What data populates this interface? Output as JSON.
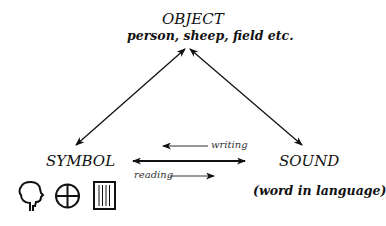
{
  "diagram": {
    "nodes": {
      "object": {
        "title": "OBJECT",
        "subtitle": "person, sheep, field etc."
      },
      "symbol": {
        "title": "SYMBOL"
      },
      "sound": {
        "title": "SOUND",
        "subtitle": "(word in language)"
      }
    },
    "edges": [
      {
        "from": "symbol",
        "to": "object",
        "type": "bidirectional"
      },
      {
        "from": "sound",
        "to": "object",
        "type": "bidirectional"
      },
      {
        "from": "symbol",
        "to": "sound",
        "type": "bidirectional"
      }
    ],
    "arrow_labels": {
      "writing": "writing",
      "reading": "reading"
    },
    "symbol_icons": [
      "head-silhouette-icon",
      "circle-cross-icon",
      "ruled-rectangle-icon"
    ]
  }
}
